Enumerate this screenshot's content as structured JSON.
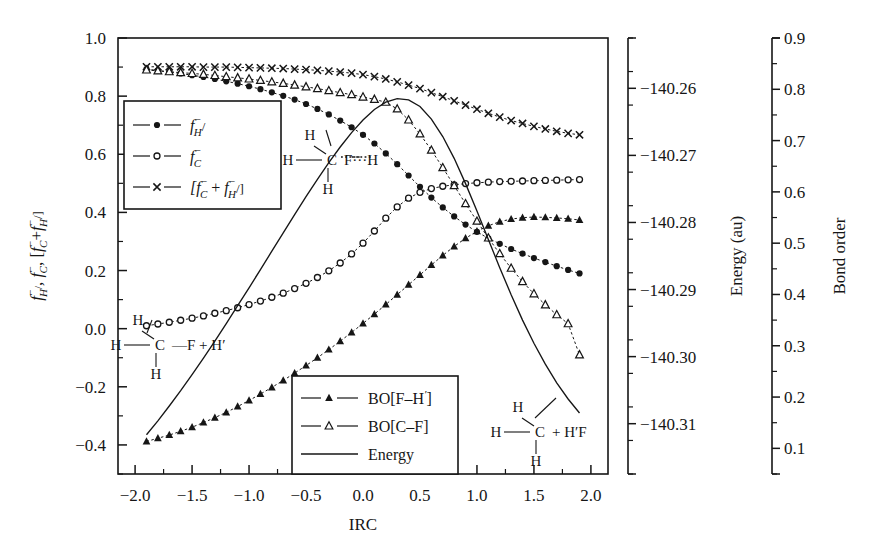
{
  "figure": {
    "xlabel": "IRC",
    "ylabel_left_parts": [
      "f",
      "H/",
      "-",
      ", f",
      "C",
      "-",
      ", [f",
      "C",
      "-",
      " + f",
      "H/",
      "-",
      "]"
    ],
    "ylabel_left_plain": "f⁻H/, f⁻C, [f⁻C+f⁻H/]",
    "ylabel_right_1": "Energy (au)",
    "ylabel_right_2": "Bond order"
  },
  "axes": {
    "x": {
      "label": "IRC",
      "min": -2.15,
      "max": 2.15,
      "ticks": [
        -2.0,
        -1.5,
        -1.0,
        -0.5,
        0.0,
        0.5,
        1.0,
        1.5,
        2.0
      ],
      "tick_labels": [
        "-2.0",
        "-1.5",
        "-1.0",
        "-0.5",
        "0.0",
        "0.5",
        "1.0",
        "1.5",
        "2.0"
      ],
      "minor_step": 0.25
    },
    "y_left": {
      "label": "f⁻H/, f⁻C, [f⁻C+f⁻H/]",
      "min": -0.5,
      "max": 1.0,
      "ticks": [
        1.0,
        0.8,
        0.6,
        0.4,
        0.2,
        0.0,
        -0.2,
        -0.4
      ],
      "tick_labels": [
        "1.0",
        "0.8",
        "0.6",
        "0.4",
        "0.2",
        "0.0",
        "-0.2",
        "-0.4"
      ],
      "minor_step": 0.1
    },
    "y_right_energy": {
      "label": "Energy (au)",
      "min": -140.3175,
      "max": -140.2525,
      "ticks": [
        -140.26,
        -140.27,
        -140.28,
        -140.29,
        -140.3,
        -140.31
      ],
      "tick_labels": [
        "−140.26",
        "−140.27",
        "−140.28",
        "−140.29",
        "−140.30",
        "−140.31"
      ],
      "minor_step": 0.005
    },
    "y_right_bond": {
      "label": "Bond order",
      "min": 0.05,
      "max": 0.9,
      "ticks": [
        0.9,
        0.8,
        0.7,
        0.6,
        0.5,
        0.4,
        0.3,
        0.2,
        0.1
      ],
      "tick_labels": [
        "0.9",
        "0.8",
        "0.7",
        "0.6",
        "0.5",
        "0.4",
        "0.3",
        "0.2",
        "0.1"
      ],
      "minor_step": 0.05
    }
  },
  "legend_top": {
    "items": [
      {
        "marker": "filled-circle",
        "label": "f⁻H/",
        "base": "f",
        "sub": "H",
        "trail": "/"
      },
      {
        "marker": "open-circle",
        "label": "f⁻C",
        "base": "f",
        "sub": "C",
        "trail": ""
      },
      {
        "marker": "cross",
        "label": "[f⁻C + f⁻H/]",
        "base": "[f",
        "sub": "C",
        "trail": " + f⁻H/]"
      }
    ]
  },
  "legend_bottom": {
    "items": [
      {
        "marker": "filled-triangle",
        "label": "BO[F–H′]"
      },
      {
        "marker": "open-triangle",
        "label": "BO[C–F]"
      },
      {
        "marker": "line",
        "label": "Energy"
      }
    ]
  },
  "annotations": {
    "reactant": {
      "top": "H",
      "left": "H",
      "center": "C",
      "right": "—F + H′",
      "bottom": "H",
      "caption": "H–CH2–F + H′"
    },
    "transition": {
      "top": "H",
      "left": "H",
      "center": "C",
      "right": "F···H",
      "bottom": "H",
      "caption": "H–CH2···F···H"
    },
    "product": {
      "top": "H",
      "left": "H",
      "center": "C",
      "right": "+ H′F",
      "bottom": "H",
      "caption": "H–CH2 + H′F"
    }
  },
  "chart_data": {
    "type": "line",
    "title": "",
    "xlabel": "IRC",
    "ylabel": "f⁻H/, f⁻C, [f⁻C+f⁻H/]",
    "ylabel_secondary": "Energy (au)",
    "ylabel_tertiary": "Bond order",
    "xlim": [
      -2.15,
      2.15
    ],
    "ylim": [
      -0.5,
      1.0
    ],
    "ylim_energy": [
      -140.3175,
      -140.2525
    ],
    "ylim_bond": [
      0.05,
      0.9
    ],
    "grid": false,
    "legend_position": "upper-left and lower-center",
    "x": [
      -1.9,
      -1.8,
      -1.7,
      -1.6,
      -1.5,
      -1.4,
      -1.3,
      -1.2,
      -1.1,
      -1.0,
      -0.9,
      -0.8,
      -0.7,
      -0.6,
      -0.5,
      -0.4,
      -0.3,
      -0.2,
      -0.1,
      0.0,
      0.1,
      0.2,
      0.3,
      0.4,
      0.5,
      0.6,
      0.7,
      0.8,
      0.9,
      1.0,
      1.1,
      1.2,
      1.3,
      1.4,
      1.5,
      1.6,
      1.7,
      1.8,
      1.9
    ],
    "series": [
      {
        "name": "f⁻H/",
        "marker": "filled-circle",
        "axis": "left",
        "values": [
          0.893,
          0.888,
          0.883,
          0.878,
          0.872,
          0.866,
          0.859,
          0.851,
          0.843,
          0.834,
          0.824,
          0.813,
          0.801,
          0.788,
          0.773,
          0.756,
          0.737,
          0.716,
          0.693,
          0.667,
          0.637,
          0.603,
          0.566,
          0.527,
          0.488,
          0.451,
          0.417,
          0.386,
          0.358,
          0.333,
          0.311,
          0.292,
          0.274,
          0.258,
          0.243,
          0.229,
          0.215,
          0.202,
          0.19
        ]
      },
      {
        "name": "f⁻C",
        "marker": "open-circle",
        "axis": "left",
        "values": [
          0.01,
          0.016,
          0.022,
          0.029,
          0.036,
          0.044,
          0.053,
          0.062,
          0.072,
          0.083,
          0.095,
          0.108,
          0.122,
          0.138,
          0.156,
          0.176,
          0.199,
          0.226,
          0.257,
          0.294,
          0.336,
          0.38,
          0.419,
          0.449,
          0.469,
          0.482,
          0.49,
          0.495,
          0.499,
          0.502,
          0.504,
          0.506,
          0.507,
          0.508,
          0.509,
          0.51,
          0.511,
          0.512,
          0.513
        ]
      },
      {
        "name": "[f⁻C + f⁻H/]",
        "marker": "cross",
        "axis": "left",
        "values": [
          0.901,
          0.901,
          0.901,
          0.901,
          0.901,
          0.9,
          0.9,
          0.9,
          0.899,
          0.898,
          0.897,
          0.896,
          0.895,
          0.893,
          0.891,
          0.889,
          0.886,
          0.883,
          0.879,
          0.874,
          0.867,
          0.859,
          0.849,
          0.838,
          0.826,
          0.812,
          0.798,
          0.784,
          0.769,
          0.755,
          0.741,
          0.728,
          0.716,
          0.706,
          0.696,
          0.687,
          0.679,
          0.672,
          0.667
        ]
      },
      {
        "name": "BO[F–H′]",
        "marker": "filled-triangle",
        "axis": "left",
        "values": [
          -0.388,
          -0.377,
          -0.366,
          -0.353,
          -0.339,
          -0.323,
          -0.306,
          -0.288,
          -0.268,
          -0.247,
          -0.225,
          -0.202,
          -0.178,
          -0.153,
          -0.127,
          -0.1,
          -0.072,
          -0.043,
          -0.013,
          0.018,
          0.05,
          0.083,
          0.117,
          0.151,
          0.185,
          0.219,
          0.252,
          0.283,
          0.311,
          0.335,
          0.354,
          0.368,
          0.377,
          0.382,
          0.384,
          0.383,
          0.381,
          0.378,
          0.374
        ]
      },
      {
        "name": "BO[C–F]",
        "marker": "open-triangle",
        "axis": "left",
        "values": [
          0.89,
          0.887,
          0.884,
          0.881,
          0.878,
          0.875,
          0.871,
          0.867,
          0.863,
          0.859,
          0.854,
          0.849,
          0.844,
          0.838,
          0.832,
          0.826,
          0.819,
          0.812,
          0.805,
          0.797,
          0.789,
          0.779,
          0.756,
          0.718,
          0.67,
          0.614,
          0.554,
          0.492,
          0.43,
          0.37,
          0.312,
          0.258,
          0.208,
          0.162,
          0.12,
          0.082,
          0.048,
          0.017,
          -0.09
        ]
      },
      {
        "name": "Energy",
        "marker": "line",
        "axis": "energy",
        "values": [
          0.09,
          0.122,
          0.156,
          0.191,
          0.228,
          0.266,
          0.305,
          0.345,
          0.386,
          0.427,
          0.469,
          0.511,
          0.553,
          0.595,
          0.636,
          0.676,
          0.714,
          0.75,
          0.783,
          0.812,
          0.836,
          0.853,
          0.861,
          0.858,
          0.843,
          0.814,
          0.774,
          0.724,
          0.666,
          0.603,
          0.538,
          0.473,
          0.411,
          0.353,
          0.3,
          0.252,
          0.209,
          0.172,
          0.14
        ]
      }
    ]
  }
}
